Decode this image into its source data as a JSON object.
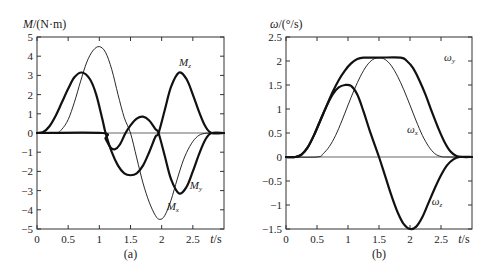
{
  "chart_data": [
    {
      "id": "a",
      "type": "line",
      "panel_label": "(a)",
      "ylabel_symbol": "M",
      "ylabel_unit": "/(N·m)",
      "xlabel_symbol": "t",
      "xlabel_unit": "/s",
      "xlim": [
        0,
        3
      ],
      "ylim": [
        -5,
        5
      ],
      "xticks": [
        0,
        0.5,
        1,
        1.5,
        2,
        2.5
      ],
      "xtick_labels": [
        "0",
        "0.5",
        "1",
        "1.5",
        "2",
        "2.5"
      ],
      "yticks": [
        5,
        4,
        3,
        2,
        1,
        0,
        -1,
        -2,
        -3,
        -4,
        -5
      ],
      "ytick_labels": [
        "5",
        "4",
        "3",
        "2",
        "1",
        "0",
        "−1",
        "−2",
        "−3",
        "−4",
        "−5"
      ],
      "grid": false,
      "zero_line": true,
      "series": [
        {
          "name": "M_z",
          "label_main": "M",
          "label_sub": "z",
          "weight": "thick",
          "x": [
            0,
            0.1,
            0.2,
            0.3,
            0.4,
            0.5,
            0.6,
            0.72,
            0.85,
            0.95,
            1.05,
            1.1,
            1.2,
            1.3,
            1.4,
            1.5,
            1.6,
            1.7,
            1.8,
            1.9,
            1.95,
            2.05,
            2.15,
            2.28,
            2.4,
            2.5,
            2.6,
            2.7,
            2.8,
            3.0
          ],
          "y": [
            0,
            0.05,
            0.35,
            0.9,
            1.6,
            2.3,
            2.9,
            3.15,
            2.8,
            2.0,
            0.7,
            0,
            -1.0,
            -1.7,
            -2.1,
            -2.2,
            -2.1,
            -1.7,
            -1.0,
            -0.2,
            0,
            1.2,
            2.4,
            3.15,
            2.8,
            2.0,
            1.1,
            0.35,
            0,
            0
          ],
          "label_pos": [
            2.28,
            3.5
          ]
        },
        {
          "name": "M_y",
          "label_main": "M",
          "label_sub": "y",
          "weight": "thick",
          "x": [
            0,
            1.05,
            1.1,
            1.18,
            1.25,
            1.33,
            1.42,
            1.5,
            1.6,
            1.7,
            1.8,
            1.9,
            1.95,
            2.05,
            2.15,
            2.28,
            2.4,
            2.5,
            2.6,
            2.7,
            2.8,
            3.0
          ],
          "y": [
            0,
            0,
            -0.3,
            -0.75,
            -0.85,
            -0.6,
            0,
            0.4,
            0.75,
            0.85,
            0.65,
            0.2,
            0,
            -1.2,
            -2.4,
            -3.15,
            -2.8,
            -2.0,
            -1.1,
            -0.35,
            0,
            0
          ],
          "label_pos": [
            2.45,
            -2.9
          ]
        },
        {
          "name": "M_x",
          "label_main": "M",
          "label_sub": "x",
          "weight": "thin",
          "x": [
            0,
            0.3,
            0.4,
            0.5,
            0.6,
            0.7,
            0.8,
            0.9,
            1.0,
            1.1,
            1.2,
            1.3,
            1.4,
            1.5,
            1.6,
            1.7,
            1.8,
            1.9,
            1.97,
            2.05,
            2.15,
            2.25,
            2.35,
            2.45,
            2.55,
            2.65,
            2.8,
            3.0
          ],
          "y": [
            0,
            0,
            0.2,
            0.7,
            1.6,
            2.7,
            3.7,
            4.3,
            4.5,
            4.2,
            3.3,
            2.0,
            0.8,
            0,
            -1.3,
            -2.6,
            -3.6,
            -4.3,
            -4.5,
            -4.3,
            -3.5,
            -2.4,
            -1.4,
            -0.7,
            -0.25,
            -0.05,
            0,
            0
          ],
          "label_pos": [
            2.08,
            -4.0
          ]
        }
      ]
    },
    {
      "id": "b",
      "type": "line",
      "panel_label": "(b)",
      "ylabel_symbol": "ω",
      "ylabel_unit": "/(°/s)",
      "xlabel_symbol": "t",
      "xlabel_unit": "/s",
      "xlim": [
        0,
        3
      ],
      "ylim": [
        -1.5,
        2.5
      ],
      "xticks": [
        0,
        0.5,
        1,
        1.5,
        2,
        2.5
      ],
      "xtick_labels": [
        "0",
        "0.5",
        "1",
        "1.5",
        "2",
        "2.5"
      ],
      "yticks": [
        2.5,
        2,
        1.5,
        1,
        0.5,
        0,
        -0.5,
        -1,
        -1.5
      ],
      "ytick_labels": [
        "2.5",
        "2",
        "1.5",
        "1",
        "0.5",
        "0",
        "−0.5",
        "−1",
        "−1.5"
      ],
      "grid": false,
      "zero_line": true,
      "series": [
        {
          "name": "ω_y",
          "label_main": "ω",
          "label_sub": "y",
          "weight": "thick",
          "x": [
            0,
            0.15,
            0.25,
            0.35,
            0.45,
            0.55,
            0.65,
            0.75,
            0.85,
            0.95,
            1.05,
            1.15,
            1.25,
            1.5,
            1.85,
            1.95,
            2.05,
            2.15,
            2.25,
            2.35,
            2.45,
            2.55,
            2.65,
            2.75,
            2.85,
            3.0
          ],
          "y": [
            0,
            0,
            0.05,
            0.2,
            0.45,
            0.75,
            1.05,
            1.35,
            1.6,
            1.8,
            1.95,
            2.04,
            2.07,
            2.07,
            2.07,
            2.0,
            1.85,
            1.6,
            1.3,
            0.95,
            0.62,
            0.33,
            0.12,
            0.02,
            0,
            0
          ],
          "label_pos": [
            2.55,
            2.0
          ]
        },
        {
          "name": "ω_x",
          "label_main": "ω",
          "label_sub": "x",
          "weight": "thin",
          "x": [
            0,
            0.5,
            0.6,
            0.7,
            0.8,
            0.9,
            1.0,
            1.1,
            1.2,
            1.3,
            1.4,
            1.5,
            1.6,
            1.7,
            1.8,
            1.9,
            2.0,
            2.1,
            2.2,
            2.3,
            2.4,
            2.5,
            2.6,
            3.0
          ],
          "y": [
            0,
            0,
            0.07,
            0.22,
            0.45,
            0.75,
            1.08,
            1.4,
            1.68,
            1.9,
            2.03,
            2.07,
            2.03,
            1.9,
            1.68,
            1.4,
            1.08,
            0.75,
            0.45,
            0.22,
            0.07,
            0.01,
            0,
            0
          ],
          "label_pos": [
            1.95,
            0.5
          ]
        },
        {
          "name": "ω_z",
          "label_main": "ω",
          "label_sub": "z",
          "weight": "thick",
          "x": [
            0,
            0.15,
            0.25,
            0.35,
            0.45,
            0.55,
            0.65,
            0.75,
            0.85,
            0.95,
            1.05,
            1.15,
            1.25,
            1.35,
            1.5,
            1.6,
            1.7,
            1.8,
            1.9,
            2.0,
            2.1,
            2.2,
            2.3,
            2.4,
            2.5,
            2.6,
            2.7,
            2.8,
            3.0
          ],
          "y": [
            0,
            0,
            0.05,
            0.2,
            0.45,
            0.75,
            1.05,
            1.3,
            1.45,
            1.5,
            1.48,
            1.3,
            0.95,
            0.55,
            0,
            -0.4,
            -0.8,
            -1.15,
            -1.4,
            -1.5,
            -1.45,
            -1.25,
            -0.95,
            -0.65,
            -0.38,
            -0.17,
            -0.05,
            0,
            0
          ],
          "label_pos": [
            2.35,
            -1.0
          ]
        }
      ]
    }
  ]
}
